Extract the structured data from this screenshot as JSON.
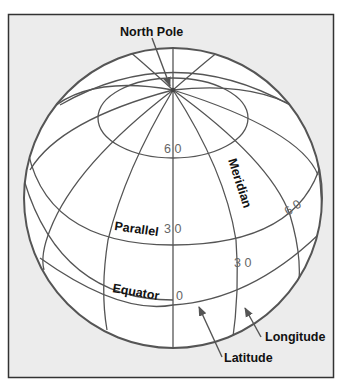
{
  "figure": {
    "frame_bg": "#ececec",
    "frame_border": "#333333",
    "globe_fill": "#ffffff",
    "line_color": "#555555",
    "labels": {
      "north_pole": "North Pole",
      "meridian": "Meridian",
      "parallel": "Parallel",
      "equator": "Equator",
      "longitude": "Longitude",
      "latitude": "Latitude"
    },
    "numbers": {
      "lat_60": "6 0",
      "lat_30": "3 0",
      "lat_0": "0",
      "lon_60": "6 0",
      "lon_30": "3 0"
    }
  }
}
